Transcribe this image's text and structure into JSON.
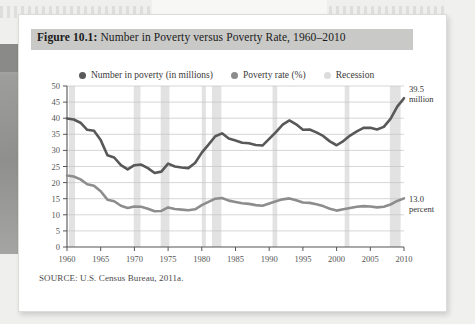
{
  "figure": {
    "label": "Figure 10.1:",
    "title": " Number in Poverty versus Poverty Rate, 1960–2010",
    "source": "SOURCE: U.S. Census Bureau, 2011a."
  },
  "legend": {
    "items": [
      {
        "label": "Number in poverty (in millions)",
        "color": "#595959"
      },
      {
        "label": "Poverty rate (%)",
        "color": "#8c8c8c"
      },
      {
        "label": "Recession",
        "color": "#dcdcdc"
      }
    ]
  },
  "annotations": [
    {
      "name": "number-in-poverty-endpoint",
      "line1": "39.5",
      "line2": "million"
    },
    {
      "name": "poverty-rate-endpoint",
      "line1": "13.0",
      "line2": "percent"
    }
  ],
  "chart_data": {
    "type": "line",
    "title": "Number in Poverty versus Poverty Rate, 1960–2010",
    "xlabel": "",
    "ylabel": "",
    "xlim": [
      1960,
      2010
    ],
    "ylim": [
      0,
      50
    ],
    "ytick_values": [
      0,
      5,
      10,
      15,
      20,
      25,
      30,
      35,
      40,
      45,
      50
    ],
    "xtick_values": [
      1960,
      1965,
      1970,
      1975,
      1980,
      1985,
      1990,
      1995,
      2000,
      2005,
      2010
    ],
    "grid": true,
    "legend_position": "top",
    "x": [
      1960,
      1961,
      1962,
      1963,
      1964,
      1965,
      1966,
      1967,
      1968,
      1969,
      1970,
      1971,
      1972,
      1973,
      1974,
      1975,
      1976,
      1977,
      1978,
      1979,
      1980,
      1981,
      1982,
      1983,
      1984,
      1985,
      1986,
      1987,
      1988,
      1989,
      1990,
      1991,
      1992,
      1993,
      1994,
      1995,
      1996,
      1997,
      1998,
      1999,
      2000,
      2001,
      2002,
      2003,
      2004,
      2005,
      2006,
      2007,
      2008,
      2009,
      2010
    ],
    "series": [
      {
        "name": "Number in poverty (in millions)",
        "color": "#585858",
        "values": [
          39.9,
          39.6,
          38.6,
          36.4,
          36.1,
          33.2,
          28.5,
          27.8,
          25.4,
          24.1,
          25.4,
          25.6,
          24.5,
          23.0,
          23.4,
          25.9,
          25.0,
          24.7,
          24.5,
          26.1,
          29.3,
          31.8,
          34.4,
          35.3,
          33.7,
          33.1,
          32.4,
          32.2,
          31.7,
          31.5,
          33.6,
          35.7,
          38.0,
          39.3,
          38.1,
          36.4,
          36.5,
          35.6,
          34.5,
          32.8,
          31.6,
          32.9,
          34.6,
          35.9,
          37.0,
          37.0,
          36.5,
          37.3,
          39.8,
          43.6,
          46.2
        ]
      },
      {
        "name": "Poverty rate (%)",
        "color": "#8d8d8d",
        "values": [
          22.2,
          21.9,
          21.0,
          19.5,
          19.0,
          17.3,
          14.7,
          14.2,
          12.8,
          12.1,
          12.6,
          12.5,
          11.9,
          11.1,
          11.2,
          12.3,
          11.8,
          11.6,
          11.4,
          11.7,
          13.0,
          14.0,
          15.0,
          15.2,
          14.4,
          14.0,
          13.6,
          13.4,
          13.0,
          12.8,
          13.5,
          14.2,
          14.8,
          15.1,
          14.5,
          13.8,
          13.7,
          13.3,
          12.7,
          11.9,
          11.3,
          11.7,
          12.1,
          12.5,
          12.7,
          12.6,
          12.3,
          12.5,
          13.2,
          14.3,
          15.1
        ]
      }
    ],
    "recessions": [
      {
        "start": 1960.3,
        "end": 1961.2
      },
      {
        "start": 1969.9,
        "end": 1970.9
      },
      {
        "start": 1973.9,
        "end": 1975.2
      },
      {
        "start": 1980.0,
        "end": 1980.6
      },
      {
        "start": 1981.5,
        "end": 1982.9
      },
      {
        "start": 1990.5,
        "end": 1991.2
      },
      {
        "start": 2001.2,
        "end": 2001.9
      },
      {
        "start": 2007.9,
        "end": 2009.5
      }
    ],
    "recession_color": "#e2e2e2"
  }
}
